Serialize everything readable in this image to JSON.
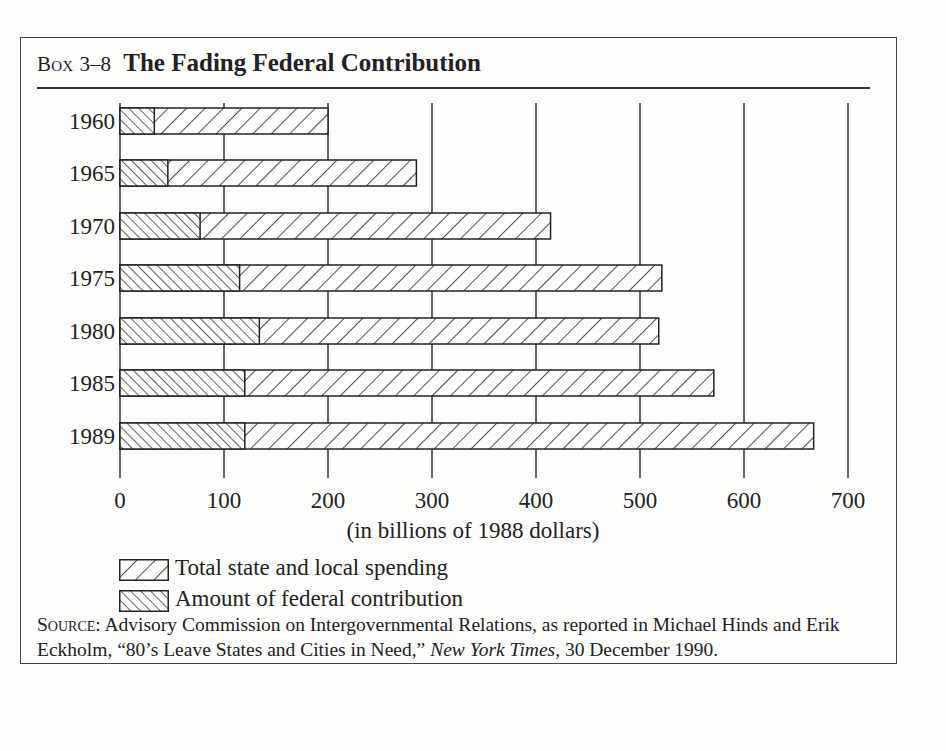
{
  "header": {
    "box_label": "Box",
    "box_number": "3–8",
    "title": "The Fading Federal Contribution"
  },
  "chart_data": {
    "type": "bar",
    "orientation": "horizontal",
    "title": "The Fading Federal Contribution",
    "xlabel": "(in billions of 1988 dollars)",
    "ylabel": "",
    "categories": [
      "1960",
      "1965",
      "1970",
      "1975",
      "1980",
      "1985",
      "1989"
    ],
    "series": [
      {
        "name": "Total state and local spending",
        "pattern": "back-diagonal",
        "values": [
          200,
          285,
          414,
          521,
          518,
          571,
          667
        ]
      },
      {
        "name": "Amount of federal contribution",
        "pattern": "forward-diagonal",
        "values": [
          33,
          46,
          77,
          115,
          134,
          120,
          120
        ]
      }
    ],
    "xlim": [
      0,
      700
    ],
    "xticks": [
      0,
      100,
      200,
      300,
      400,
      500,
      600,
      700
    ],
    "grid": "vertical lines at each 100",
    "legend_position": "below chart"
  },
  "legend": {
    "items": [
      {
        "label": "Total state and local spending"
      },
      {
        "label": "Amount of federal contribution"
      }
    ]
  },
  "source": {
    "label": "Source:",
    "text_1": " Advisory Commission on Intergovernmental Relations, as reported in Michael Hinds and Erik Eckholm, “80’s Leave States and Cities in Need,” ",
    "publication": "New York Times",
    "text_2": ", 30 December 1990."
  },
  "colors": {
    "ink": "#222222",
    "background": "#fdfdfc"
  }
}
